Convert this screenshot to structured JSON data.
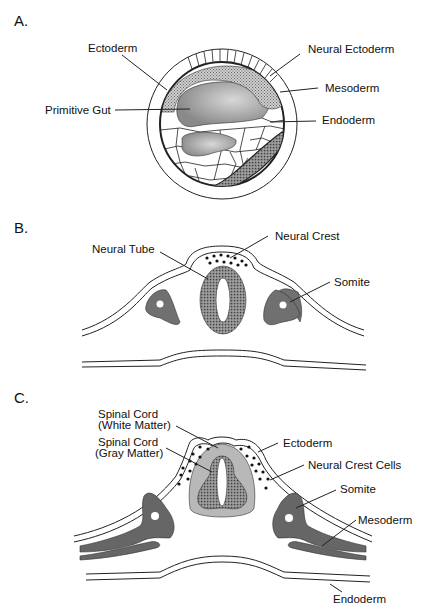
{
  "figure": {
    "panels": [
      {
        "id": "A",
        "label": "A.",
        "annotations": {
          "ectoderm": "Ectoderm",
          "neural_ectoderm": "Neural Ectoderm",
          "mesoderm": "Mesoderm",
          "primitive_gut": "Primitive Gut",
          "endoderm": "Endoderm"
        }
      },
      {
        "id": "B",
        "label": "B.",
        "annotations": {
          "neural_tube": "Neural Tube",
          "neural_crest": "Neural Crest",
          "somite": "Somite"
        }
      },
      {
        "id": "C",
        "label": "C.",
        "annotations": {
          "white_matter_1": "Spinal Cord",
          "white_matter_2": "(White Matter)",
          "gray_matter_1": "Spinal Cord",
          "gray_matter_2": "(Gray Matter)",
          "ectoderm": "Ectoderm",
          "neural_crest_cells": "Neural Crest Cells",
          "somite": "Somite",
          "mesoderm": "Mesoderm",
          "endoderm": "Endoderm"
        }
      }
    ],
    "colors": {
      "dark_tissue": "#6e6e6e",
      "mid_tissue": "#9a9a9a",
      "light_tissue": "#c4c4c4",
      "outline": "#222222"
    }
  }
}
